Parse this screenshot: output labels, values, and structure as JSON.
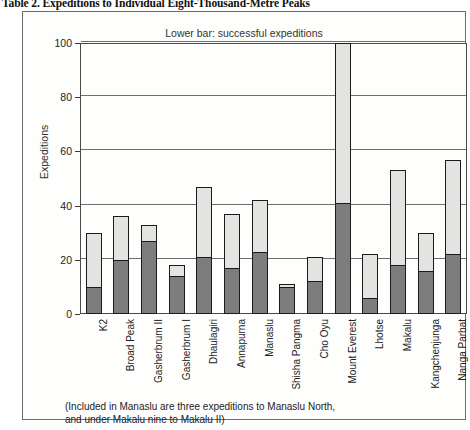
{
  "figure": {
    "title": "Table 2. Expeditions to Individual Eight-Thousand-Metre Peaks",
    "legend_note": "Lower bar: successful expeditions",
    "footnote_line1": "(Included in Manaslu are three expeditions to Manaslu North,",
    "footnote_line2": "and under Makalu nine to Makalu II)"
  },
  "colors": {
    "total_bar": "#e3e3e1",
    "success_bar": "#7d7d7d",
    "outline": "#1b1b1b",
    "gridline": "#6e6e6e",
    "background": "#fefefd"
  },
  "chart_data": {
    "type": "bar",
    "title": "Table 2. Expeditions to Individual Eight-Thousand-Metre Peaks",
    "xlabel": "",
    "ylabel": "Expeditions",
    "ylim": [
      0,
      100
    ],
    "yticks": [
      0,
      20,
      40,
      60,
      80,
      100
    ],
    "ytick_labels": [
      "0",
      "20",
      "40",
      "60",
      "80",
      "100"
    ],
    "grid": true,
    "legend_position": "top-center",
    "annotations": [
      "Lower bar: successful expeditions",
      "(Included in Manaslu are three expeditions to Manaslu North, and under Makalu nine to Makalu II)"
    ],
    "categories": [
      "K2",
      "Broad Peak",
      "Gasherbrum II",
      "Gasherbrum I",
      "Dhaulagiri",
      "Annapurna",
      "Manaslu",
      "Shisha Pangma",
      "Cho Oyu",
      "Mount Everest",
      "Lhotse",
      "Makalu",
      "Kangchenjunga",
      "Nanga Parbat"
    ],
    "series": [
      {
        "name": "Total expeditions",
        "values": [
          30,
          36,
          33,
          18,
          47,
          37,
          42,
          11,
          21,
          100,
          22,
          53,
          30,
          57
        ]
      },
      {
        "name": "Successful expeditions",
        "values": [
          10,
          20,
          27,
          14,
          21,
          17,
          23,
          10,
          12,
          41,
          6,
          18,
          16,
          22
        ]
      }
    ]
  }
}
